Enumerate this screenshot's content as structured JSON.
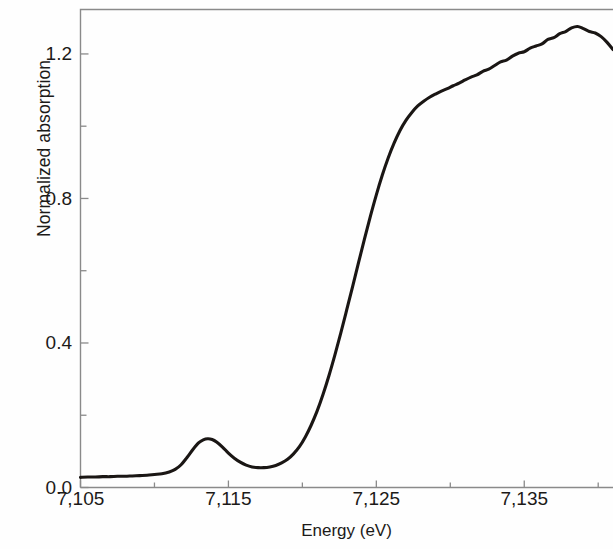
{
  "chart_data": {
    "type": "line",
    "title": "",
    "subtitle": "",
    "xlabel": "Energy (eV)",
    "ylabel": "Normalized absorption",
    "xlim": [
      7105,
      7141
    ],
    "ylim": [
      0.0,
      1.323
    ],
    "grid": false,
    "legend": null,
    "annotations": [],
    "x_major_ticks": [
      7105,
      7115,
      7125,
      7135
    ],
    "x_major_tick_labels": [
      "7,105",
      "7,115",
      "7,125",
      "7,135"
    ],
    "x_minor_tick_interval": 5,
    "y_major_ticks": [
      0.0,
      0.4,
      0.8,
      1.2
    ],
    "y_major_tick_labels": [
      "0.0",
      "0.4",
      "0.8",
      "1.2"
    ],
    "y_minor_ticks": [
      0.2,
      0.6,
      1.0
    ],
    "line_color": "#1a1614",
    "line_width": 3.1,
    "axis_color": "#8a8a8a",
    "background_color": "#fefefe",
    "series": [
      {
        "name": "Normalized absorption",
        "x": [
          7105.0,
          7105.5,
          7106.0,
          7106.5,
          7107.0,
          7107.5,
          7108.0,
          7108.5,
          7109.0,
          7109.5,
          7110.0,
          7110.5,
          7111.0,
          7111.4,
          7111.8,
          7112.2,
          7112.6,
          7113.0,
          7113.3,
          7113.6,
          7113.9,
          7114.2,
          7114.6,
          7115.0,
          7115.4,
          7115.8,
          7116.2,
          7116.6,
          7117.0,
          7117.4,
          7117.8,
          7118.2,
          7118.6,
          7119.0,
          7119.4,
          7119.8,
          7120.2,
          7120.6,
          7121.0,
          7121.4,
          7121.8,
          7122.2,
          7122.6,
          7123.0,
          7123.4,
          7123.8,
          7124.2,
          7124.6,
          7125.0,
          7125.4,
          7125.8,
          7126.2,
          7126.6,
          7127.0,
          7127.4,
          7127.8,
          7128.2,
          7128.6,
          7129.0,
          7129.4,
          7129.8,
          7130.2,
          7130.6,
          7131.0,
          7131.4,
          7131.8,
          7132.2,
          7132.6,
          7133.0,
          7133.4,
          7133.8,
          7134.2,
          7134.6,
          7135.0,
          7135.4,
          7135.8,
          7136.2,
          7136.6,
          7137.0,
          7137.4,
          7137.8,
          7138.2,
          7138.6,
          7139.0,
          7139.4,
          7139.8,
          7140.2,
          7140.6,
          7141.0
        ],
        "y": [
          0.028,
          0.029,
          0.029,
          0.03,
          0.03,
          0.031,
          0.031,
          0.032,
          0.033,
          0.034,
          0.036,
          0.038,
          0.043,
          0.05,
          0.063,
          0.083,
          0.105,
          0.124,
          0.132,
          0.135,
          0.133,
          0.126,
          0.112,
          0.095,
          0.081,
          0.07,
          0.062,
          0.057,
          0.055,
          0.055,
          0.057,
          0.061,
          0.068,
          0.078,
          0.093,
          0.113,
          0.14,
          0.173,
          0.212,
          0.258,
          0.31,
          0.367,
          0.428,
          0.492,
          0.557,
          0.623,
          0.688,
          0.751,
          0.81,
          0.864,
          0.912,
          0.953,
          0.988,
          1.016,
          1.038,
          1.056,
          1.069,
          1.08,
          1.089,
          1.097,
          1.104,
          1.112,
          1.119,
          1.128,
          1.136,
          1.142,
          1.152,
          1.158,
          1.168,
          1.178,
          1.183,
          1.194,
          1.202,
          1.206,
          1.216,
          1.222,
          1.228,
          1.24,
          1.245,
          1.256,
          1.262,
          1.272,
          1.276,
          1.27,
          1.262,
          1.258,
          1.248,
          1.232,
          1.212
        ]
      }
    ]
  },
  "axes": {
    "ylabel_text": "Normalized absorption",
    "xlabel_text": "Energy (eV)"
  }
}
